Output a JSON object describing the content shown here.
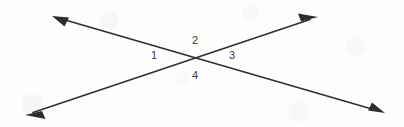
{
  "figure": {
    "type": "geometry-diagram",
    "background_color": "#fdfdfc",
    "stroke_color": "#2e2e2e",
    "label_color": "#3a3a3a",
    "canvas": {
      "width": 404,
      "height": 127
    },
    "intersection": {
      "x": 199,
      "y": 58
    },
    "lines": [
      {
        "name": "line-upper-left-to-lower-right",
        "from": {
          "x": 52,
          "y": 16
        },
        "to": {
          "x": 385,
          "y": 113
        },
        "arrowheads": [
          "start",
          "end"
        ]
      },
      {
        "name": "line-lower-left-to-upper-right",
        "from": {
          "x": 25,
          "y": 115
        },
        "to": {
          "x": 318,
          "y": 17
        },
        "arrowheads": [
          "start",
          "end"
        ]
      }
    ],
    "angle_labels": [
      {
        "id": "angle-1",
        "text": "1",
        "x": 151,
        "y": 50,
        "position": "left"
      },
      {
        "id": "angle-2",
        "text": "2",
        "x": 192,
        "y": 35,
        "position": "top"
      },
      {
        "id": "angle-3",
        "text": "3",
        "x": 229,
        "y": 50,
        "position": "right"
      },
      {
        "id": "angle-4",
        "text": "4",
        "x": 192,
        "y": 70,
        "position": "bottom"
      }
    ]
  }
}
